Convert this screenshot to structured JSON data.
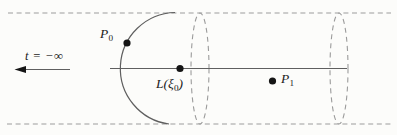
{
  "figure": {
    "colors": {
      "background": "#fcfcfa",
      "solid_stroke": "#5f5f5f",
      "dashed_stroke": "#9b9b9b",
      "point_fill": "#151515",
      "text": "#1b1b1b"
    }
  },
  "labels": {
    "time": {
      "text": "t = −∞"
    },
    "p0": {
      "base": "P",
      "sub": "0"
    },
    "p1": {
      "base": "P",
      "sub": "1"
    },
    "lxi": {
      "pre": "L(ξ",
      "sub": "0",
      "post": ")"
    }
  },
  "points": [
    {
      "label": "P0",
      "location": "on the semicircular arc, upper left"
    },
    {
      "label": "L(ξ0)",
      "location": "on the central axis line"
    },
    {
      "label": "P1",
      "location": "below the axis, right of center"
    }
  ]
}
